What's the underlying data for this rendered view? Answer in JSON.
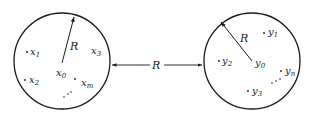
{
  "diagram": {
    "left_set": {
      "center_label": "x",
      "center_sub": "0",
      "radius_label": "R",
      "points": [
        {
          "base": "x",
          "sub": "1"
        },
        {
          "base": "x",
          "sub": "2"
        },
        {
          "base": "x",
          "sub": "3"
        },
        {
          "base": "x",
          "sub": "m"
        }
      ]
    },
    "right_set": {
      "center_label": "y",
      "center_sub": "0",
      "radius_label": "R",
      "points": [
        {
          "base": "y",
          "sub": "1"
        },
        {
          "base": "y",
          "sub": "2"
        },
        {
          "base": "y",
          "sub": "3"
        },
        {
          "base": "y",
          "sub": "n"
        }
      ]
    },
    "distance_label": "R",
    "stroke_color": "#1a1a1a"
  }
}
